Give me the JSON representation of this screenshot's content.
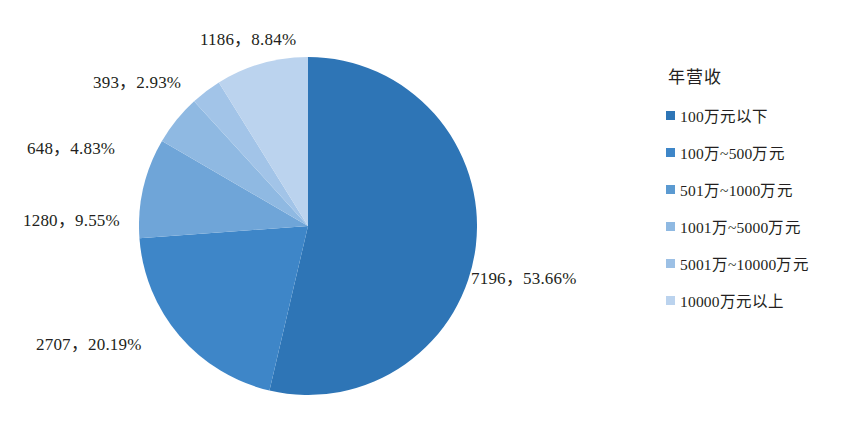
{
  "chart_data": {
    "type": "pie",
    "title": "",
    "legend_title": "年营收",
    "legend_position": "right",
    "total": 13410,
    "categories": [
      "100万元以下",
      "100万~500万元",
      "501万~1000万元",
      "1001万~5000万元",
      "5001万~10000万元",
      "10000万元以上"
    ],
    "values": [
      7196,
      2707,
      1280,
      648,
      393,
      1186
    ],
    "percentages": [
      53.66,
      20.19,
      9.55,
      4.83,
      2.93,
      8.84
    ],
    "colors": [
      "#2E75B6",
      "#3E86C8",
      "#6FA5D8",
      "#8FB9E2",
      "#A2C4E8",
      "#BBD3EE"
    ],
    "start_angle_deg": 0,
    "direction": "clockwise",
    "data_labels": [
      "7196，53.66%",
      "2707，20.19%",
      "1280，9.55%",
      "648，4.83%",
      "393，2.93%",
      "1186，8.84%"
    ]
  },
  "legend": {
    "title": "年营收",
    "items": [
      {
        "label": "100万元以下",
        "color": "#2E75B6"
      },
      {
        "label": "100万~500万元",
        "color": "#3E86C8"
      },
      {
        "label": "501万~1000万元",
        "color": "#5B9AD1"
      },
      {
        "label": "1001万~5000万元",
        "color": "#8FB9E2"
      },
      {
        "label": "5001万~10000万元",
        "color": "#9CC0E5"
      },
      {
        "label": "10000万元以上",
        "color": "#BBD3EE"
      }
    ]
  }
}
